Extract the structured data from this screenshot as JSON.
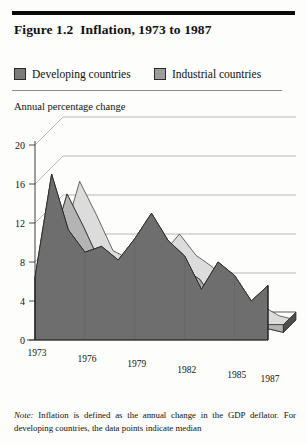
{
  "figure": {
    "title_number": "Figure 1.2",
    "title_text": "Inflation, 1973 to 1987",
    "axis_caption": "Annual percentage change",
    "note_label": "Note:",
    "note_text": " Inflation is defined as the annual change in the GDP deflator. For developing countries, the data points indicate median"
  },
  "legend": {
    "items": [
      {
        "label": "Developing countries",
        "color": "#7b7b7b"
      },
      {
        "label": "Industrial countries",
        "color": "#9d9d9d"
      }
    ]
  },
  "chart_data": {
    "type": "area",
    "xlabel": "",
    "ylabel": "Annual percentage change",
    "ylim": [
      0,
      20
    ],
    "yticks": [
      0,
      4,
      8,
      12,
      16,
      20
    ],
    "ytick_labels": [
      "0",
      "4",
      "8",
      "12",
      "16",
      "20"
    ],
    "grid": true,
    "legend_position": "top",
    "x": [
      1973,
      1974,
      1975,
      1976,
      1977,
      1978,
      1979,
      1980,
      1981,
      1982,
      1983,
      1984,
      1985,
      1986,
      1987
    ],
    "xticks": [
      1973,
      1976,
      1979,
      1982,
      1985,
      1987
    ],
    "xtick_labels": [
      "1973",
      "1976",
      "1979",
      "1982",
      "1985",
      "1987"
    ],
    "series": [
      {
        "name": "Developing countries",
        "color": "#7b7b7b",
        "values": [
          6.4,
          17.0,
          11.3,
          9.0,
          9.6,
          8.2,
          10.4,
          13.0,
          10.2,
          8.6,
          5.2,
          8.0,
          6.6,
          4.0,
          5.6
        ]
      },
      {
        "name": "Industrial countries",
        "color": "#cfcfcf",
        "values": [
          7.5,
          13.4,
          10.0,
          6.3,
          5.4,
          5.2,
          6.0,
          8.0,
          5.8,
          4.6,
          2.0,
          1.0,
          0.6,
          -0.4,
          -0.8
        ]
      }
    ]
  }
}
